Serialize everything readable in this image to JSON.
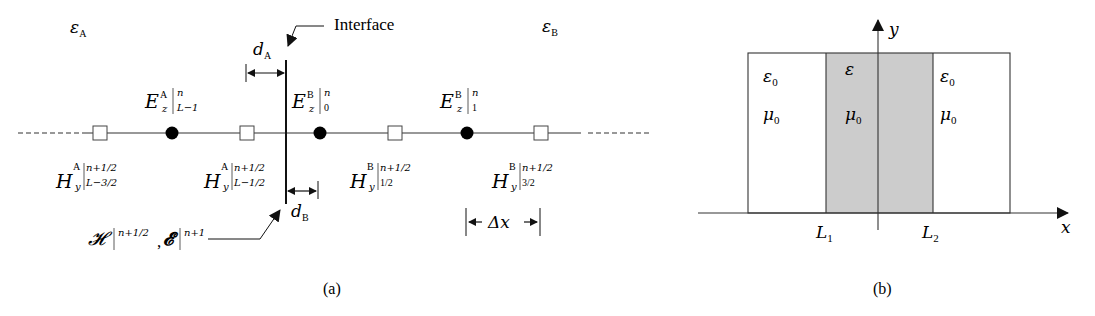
{
  "panel_a": {
    "caption": "(a)",
    "region_left_label": "ε",
    "region_left_sub": "A",
    "region_right_label": "ε",
    "region_right_sub": "B",
    "interface_label": "Interface",
    "dA_label": "d",
    "dA_sub": "A",
    "dB_label": "d",
    "dB_sub": "B",
    "dx_label": "Δx",
    "e_nodes": [
      {
        "base": "E",
        "sub": "z",
        "sup": "A",
        "bar_sup": "n",
        "bar_sub": "L−1"
      },
      {
        "base": "E",
        "sub": "z",
        "sup": "B",
        "bar_sup": "n",
        "bar_sub": "0"
      },
      {
        "base": "E",
        "sub": "z",
        "sup": "B",
        "bar_sup": "n",
        "bar_sub": "1"
      }
    ],
    "h_nodes": [
      {
        "base": "H",
        "sub": "y",
        "sup": "A",
        "bar_sup": "n+1/2",
        "bar_sub": "L−3/2"
      },
      {
        "base": "H",
        "sub": "y",
        "sup": "A",
        "bar_sup": "n+1/2",
        "bar_sub": "L−1/2"
      },
      {
        "base": "H",
        "sub": "y",
        "sup": "B",
        "bar_sup": "n+1/2",
        "bar_sub": "1/2"
      },
      {
        "base": "H",
        "sub": "y",
        "sup": "B",
        "bar_sup": "n+1/2",
        "bar_sub": "3/2"
      }
    ],
    "annotation": {
      "h_symbol": "𝓗",
      "h_sup": "n+1/2",
      "sep": ",",
      "e_symbol": "𝓔",
      "e_sup": "n+1"
    }
  },
  "panel_b": {
    "caption": "(b)",
    "x_axis": "x",
    "y_axis": "y",
    "left_region": {
      "eps": "ε",
      "eps_sub": "0",
      "mu": "μ",
      "mu_sub": "0"
    },
    "middle_region": {
      "eps": "ε",
      "mu": "μ",
      "mu_sub": "0",
      "fill": "#cccccc"
    },
    "right_region": {
      "eps": "ε",
      "eps_sub": "0",
      "mu": "μ",
      "mu_sub": "0"
    },
    "L1": "L",
    "L1_sub": "1",
    "L2": "L",
    "L2_sub": "2"
  }
}
